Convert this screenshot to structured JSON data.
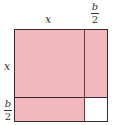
{
  "diagram": {
    "type": "completing-the-square",
    "labels": {
      "top_x": "x",
      "left_x": "x",
      "top_frac": {
        "numerator": "b",
        "denominator": "2"
      },
      "left_frac": {
        "numerator": "b",
        "denominator": "2"
      }
    },
    "colors": {
      "fill": "#f2b8bd",
      "border": "#3a2a2e",
      "empty_corner": "#ffffff"
    }
  }
}
